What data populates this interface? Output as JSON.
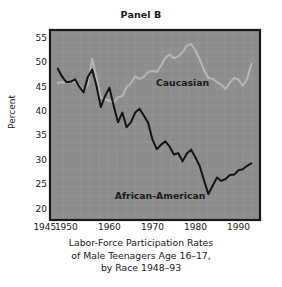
{
  "figure": {
    "title": "Panel B",
    "ylabel": "Percent",
    "caption_lines": [
      "Labor-Force Participation Rates",
      "of Male Teenagers Age 16–17,",
      "by Race 1948–93"
    ]
  },
  "colors": {
    "plot_background": "#8c8c8c",
    "axis": "#1a1a1a",
    "caucasian_line": "#b5b5b5",
    "african_american_line": "#141414",
    "text": "#1a1a1a",
    "page_background": "#ffffff"
  },
  "chart_data": {
    "type": "line",
    "title": "Panel B",
    "xlabel": "",
    "ylabel": "Percent",
    "xlim": [
      1946.2,
      1995.0
    ],
    "ylim": [
      17.9,
      56.8
    ],
    "grid": false,
    "legend": "inline-annotations",
    "xticks": [
      1945,
      1950,
      1960,
      1970,
      1980,
      1990
    ],
    "xticklabels": [
      "1945",
      "1950",
      "1960",
      "1970",
      "1980",
      "1990"
    ],
    "yticks": [
      20,
      25,
      30,
      35,
      40,
      45,
      50,
      55
    ],
    "yticklabels": [
      "20",
      "25",
      "30",
      "35",
      "40",
      "45",
      "50",
      "55"
    ],
    "annotations": [
      {
        "text": "Caucasian",
        "x": 1977.0,
        "y": 45.3
      },
      {
        "text": "African-American",
        "x": 1971.8,
        "y": 22.2
      }
    ],
    "x": [
      1948,
      1949,
      1950,
      1951,
      1952,
      1953,
      1954,
      1955,
      1956,
      1957,
      1958,
      1959,
      1960,
      1961,
      1962,
      1963,
      1964,
      1965,
      1966,
      1967,
      1968,
      1969,
      1970,
      1971,
      1972,
      1973,
      1974,
      1975,
      1976,
      1977,
      1978,
      1979,
      1980,
      1981,
      1982,
      1983,
      1984,
      1985,
      1986,
      1987,
      1988,
      1989,
      1990,
      1991,
      1992,
      1993
    ],
    "series": [
      {
        "name": "Caucasian",
        "color": "#b5b5b5",
        "values": [
          46.0,
          46.1,
          46.0,
          46.1,
          46.2,
          45.4,
          44.4,
          45.6,
          50.9,
          47.0,
          43.0,
          42.6,
          42.3,
          42.0,
          43.0,
          43.3,
          45.1,
          45.9,
          47.3,
          46.8,
          47.2,
          48.2,
          48.4,
          48.2,
          49.5,
          51.1,
          51.8,
          51.0,
          51.4,
          52.2,
          53.6,
          53.9,
          52.6,
          50.8,
          48.6,
          47.0,
          46.8,
          46.1,
          45.6,
          44.7,
          46.0,
          47.0,
          46.6,
          45.4,
          46.7,
          49.9
        ]
      },
      {
        "name": "African-American",
        "color": "#141414",
        "values": [
          48.9,
          47.3,
          46.1,
          46.2,
          46.7,
          45.2,
          44.0,
          47.2,
          48.7,
          45.4,
          41.0,
          43.3,
          45.0,
          41.3,
          37.9,
          39.9,
          36.9,
          37.9,
          39.9,
          40.7,
          39.3,
          37.8,
          34.4,
          32.4,
          33.3,
          34.0,
          32.9,
          31.3,
          31.6,
          29.9,
          31.5,
          32.3,
          30.7,
          28.9,
          26.0,
          23.2,
          24.9,
          26.6,
          25.9,
          26.3,
          27.1,
          27.2,
          28.1,
          28.3,
          29.0,
          29.5
        ]
      }
    ]
  }
}
